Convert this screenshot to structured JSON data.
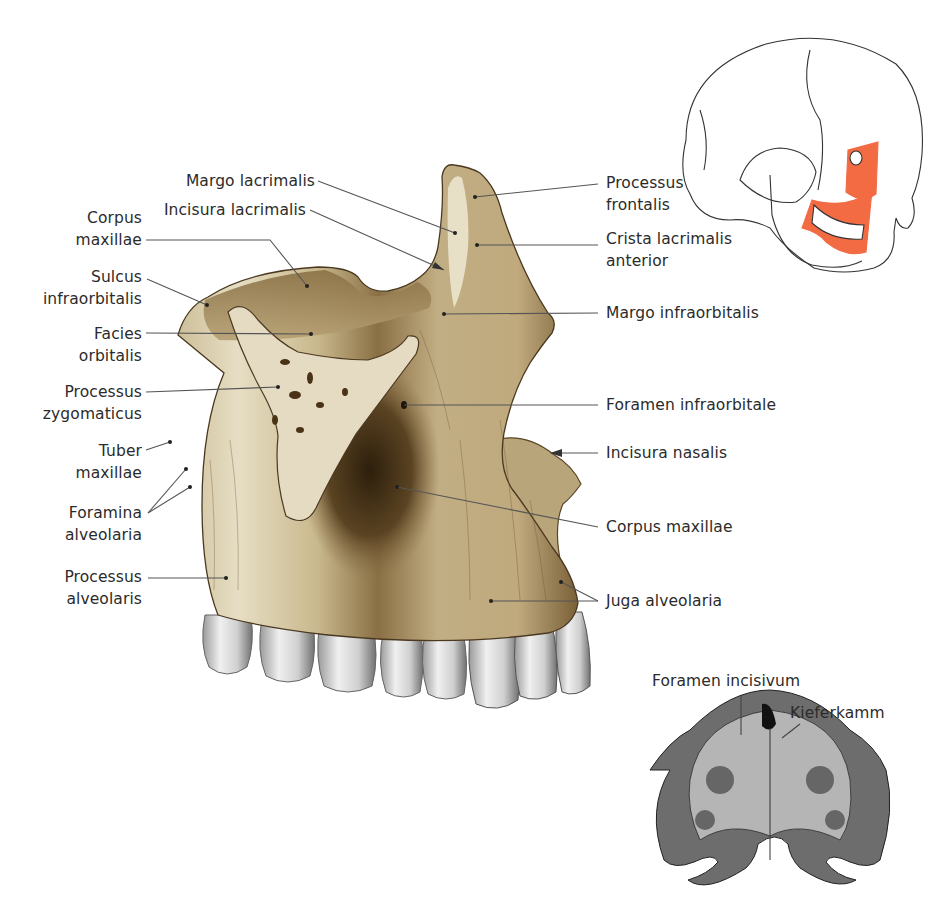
{
  "figure": {
    "colors": {
      "bone_light": "#e8e0c8",
      "bone_mid": "#b9a47a",
      "bone_dark": "#5e4a2a",
      "bone_shadow": "#3a2a14",
      "tooth": "#d9d9d9",
      "tooth_shadow": "#8a8a8a",
      "highlight_maxilla": "#f26b43",
      "leader_line": "#555555",
      "text": "#2b2b2b"
    }
  },
  "labels_left": [
    {
      "id": "margo-lacrimalis",
      "lines": [
        "Margo lacrimalis"
      ]
    },
    {
      "id": "incisura-lacrimalis",
      "lines": [
        "Incisura lacrimalis"
      ]
    },
    {
      "id": "corpus-maxillae-upper",
      "lines": [
        "Corpus",
        "maxillae"
      ]
    },
    {
      "id": "sulcus-infraorbitalis",
      "lines": [
        "Sulcus",
        "infraorbitalis"
      ]
    },
    {
      "id": "facies-orbitalis",
      "lines": [
        "Facies",
        "orbitalis"
      ]
    },
    {
      "id": "processus-zygomaticus",
      "lines": [
        "Processus",
        "zygomaticus"
      ]
    },
    {
      "id": "tuber-maxillae",
      "lines": [
        "Tuber",
        "maxillae"
      ]
    },
    {
      "id": "foramina-alveolaria",
      "lines": [
        "Foramina",
        "alveolaria"
      ]
    },
    {
      "id": "processus-alveolaris",
      "lines": [
        "Processus",
        "alveolaris"
      ]
    }
  ],
  "labels_right": [
    {
      "id": "processus-frontalis",
      "lines": [
        "Processus",
        "frontalis"
      ]
    },
    {
      "id": "crista-lacrimalis-anterior",
      "lines": [
        "Crista lacrimalis",
        "anterior"
      ]
    },
    {
      "id": "margo-infraorbitalis",
      "lines": [
        "Margo infraorbitalis"
      ]
    },
    {
      "id": "foramen-infraorbitale",
      "lines": [
        "Foramen infraorbitale"
      ]
    },
    {
      "id": "incisura-nasalis",
      "lines": [
        "Incisura nasalis"
      ]
    },
    {
      "id": "corpus-maxillae-lower",
      "lines": [
        "Corpus maxillae"
      ]
    },
    {
      "id": "juga-alveolaria",
      "lines": [
        "Juga alveolaria"
      ]
    }
  ],
  "inset_palate": {
    "labels": [
      {
        "id": "foramen-incisivum",
        "lines": [
          "Foramen incisivum"
        ]
      },
      {
        "id": "kieferkamm",
        "lines": [
          "Kieferkamm"
        ]
      }
    ]
  },
  "inset_skull": {
    "highlighted_region": "maxilla"
  }
}
